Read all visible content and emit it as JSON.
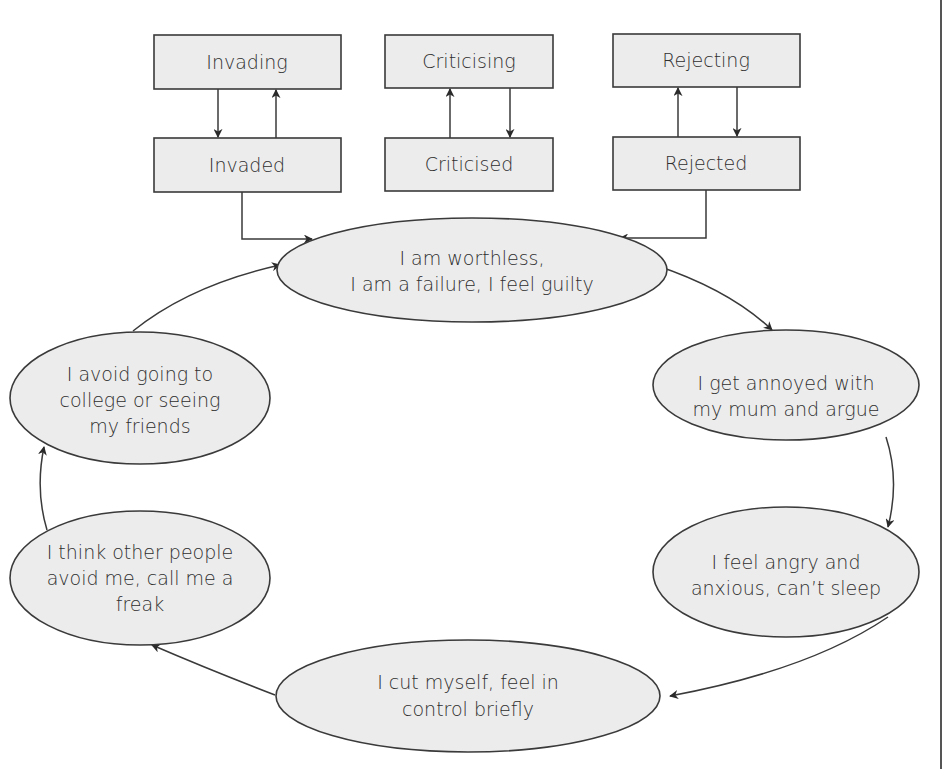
{
  "diagram": {
    "type": "cycle-with-input-pairs",
    "colors": {
      "fill": "#ececec",
      "stroke": "#3a3a3a",
      "text": "#2f2f2f"
    },
    "pairs": [
      {
        "id": "invading",
        "top": "Invading",
        "bottom": "Invaded",
        "arrows": [
          "top-to-bottom",
          "bottom-to-top"
        ]
      },
      {
        "id": "criticising",
        "top": "Criticising",
        "bottom": "Criticised",
        "arrows": [
          "bottom-to-top",
          "top-to-bottom"
        ]
      },
      {
        "id": "rejecting",
        "top": "Rejecting",
        "bottom": "Rejected",
        "arrows": [
          "bottom-to-top",
          "top-to-bottom"
        ]
      }
    ],
    "cycle": [
      {
        "id": "worthless",
        "lines": [
          "I am worthless,",
          "I am a failure, I feel guilty"
        ]
      },
      {
        "id": "annoyed",
        "lines": [
          "I get annoyed with",
          "my mum and argue"
        ]
      },
      {
        "id": "angry",
        "lines": [
          "I feel angry and",
          "anxious, can’t sleep"
        ]
      },
      {
        "id": "cut",
        "lines": [
          "I cut myself, feel in",
          "control briefly"
        ]
      },
      {
        "id": "think-others",
        "lines": [
          "I think other people",
          "avoid me, call me a",
          "freak"
        ]
      },
      {
        "id": "avoid",
        "lines": [
          "I avoid going to",
          "college or seeing",
          "my friends"
        ]
      }
    ],
    "edges": [
      {
        "from": "invaded",
        "to": "worthless"
      },
      {
        "from": "rejected",
        "to": "worthless"
      },
      {
        "from": "worthless",
        "to": "annoyed"
      },
      {
        "from": "annoyed",
        "to": "angry"
      },
      {
        "from": "angry",
        "to": "cut"
      },
      {
        "from": "cut",
        "to": "think-others"
      },
      {
        "from": "think-others",
        "to": "avoid"
      },
      {
        "from": "avoid",
        "to": "worthless"
      }
    ]
  }
}
